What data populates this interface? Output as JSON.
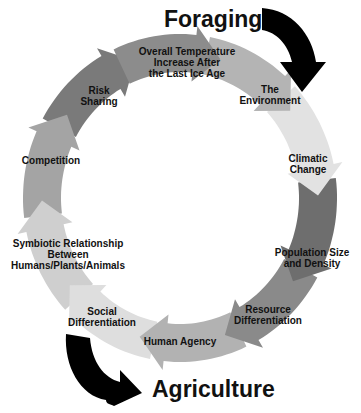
{
  "diagram": {
    "type": "cycle",
    "direction": "clockwise",
    "start_label": "Foraging",
    "end_label": "Agriculture",
    "stages": [
      {
        "id": "temperature",
        "label": "Overall Temperature Increase After the Last Ice Age",
        "lines": [
          "Overall Temperature",
          "Increase After",
          "the Last Ice Age"
        ],
        "color": "#8c8c8c"
      },
      {
        "id": "environment",
        "label": "The Environment",
        "lines": [
          "The",
          "Environment"
        ],
        "color": "#b4b4b4"
      },
      {
        "id": "climatic",
        "label": "Climatic Change",
        "lines": [
          "Climatic",
          "Change"
        ],
        "color": "#e2e2e2"
      },
      {
        "id": "population",
        "label": "Population Size and Density",
        "lines": [
          "Population Size",
          "and Density"
        ],
        "color": "#6e6e6e"
      },
      {
        "id": "resource",
        "label": "Resource Differentiation",
        "lines": [
          "Resource",
          "Differentiation"
        ],
        "color": "#8a8a8a"
      },
      {
        "id": "agency",
        "label": "Human Agency",
        "lines": [
          "Human Agency"
        ],
        "color": "#b2b2b2"
      },
      {
        "id": "social",
        "label": "Social Differentiation",
        "lines": [
          "Social",
          "Differentiation"
        ],
        "color": "#dedede"
      },
      {
        "id": "symbiotic",
        "label": "Symbiotic Relationship Between Humans/Plants/Animals",
        "lines": [
          "Symbiotic Relationship",
          "Between",
          "Humans/Plants/Animals"
        ],
        "color": "#cfcfcf"
      },
      {
        "id": "competition",
        "label": "Competition",
        "lines": [
          "Competition"
        ],
        "color": "#a4a4a4"
      },
      {
        "id": "risk",
        "label": "Risk Sharing",
        "lines": [
          "Risk",
          "Sharing"
        ],
        "color": "#7a7a7a"
      }
    ],
    "accent_arrow_color": "#000000"
  }
}
